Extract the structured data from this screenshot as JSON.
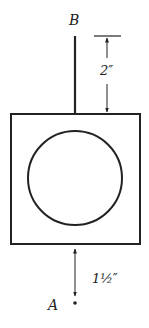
{
  "diagram": {
    "colors": {
      "stroke": "#222222",
      "background": "#ffffff"
    },
    "points": {
      "top": {
        "label": "B"
      },
      "bottom": {
        "label": "A"
      }
    },
    "dimensions": {
      "rod_length": {
        "label": "2″"
      },
      "gap_to_A": {
        "label": "1½″"
      }
    },
    "shapes": [
      "vertical-rod",
      "square-frame",
      "circle-inside-square"
    ]
  }
}
